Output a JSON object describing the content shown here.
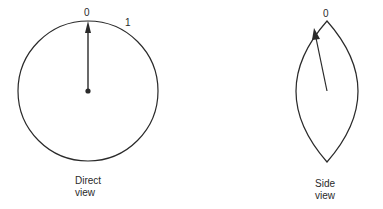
{
  "diagram": {
    "direct_view": {
      "caption_line1": "Direct",
      "caption_line2": "view",
      "tick_labels": [
        "0",
        "1"
      ],
      "shape": "circle",
      "pointer": "arrow from center dot to 0 mark"
    },
    "side_view": {
      "caption_line1": "Side",
      "caption_line2": "view",
      "tick_labels": [
        "0"
      ],
      "shape": "lens (circle seen edge-on)",
      "pointer": "arrow from center tilted toward 0 mark"
    },
    "colors": {
      "stroke": "#2a2a2a",
      "background": "#ffffff"
    }
  }
}
